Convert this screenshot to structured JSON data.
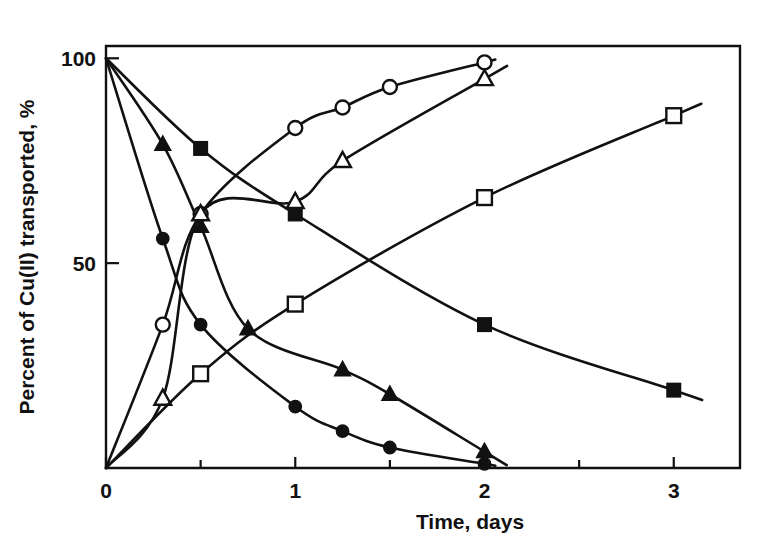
{
  "chart_data": {
    "type": "line",
    "title": "",
    "xlabel": "Time, days",
    "ylabel": "Percent of Cu(II) transported, %",
    "xlim": [
      0,
      3.35
    ],
    "ylim": [
      0,
      103
    ],
    "grid": false,
    "legend_position": "none",
    "x_ticks_major": [
      0,
      1,
      2,
      3
    ],
    "x_tick_labels": [
      "0",
      "1",
      "2",
      "3"
    ],
    "x_ticks_minor": [
      0.5,
      1.5,
      2.5
    ],
    "y_ticks_major": [
      0,
      50,
      100
    ],
    "y_tick_labels": [
      "0",
      "50",
      "100"
    ],
    "series": [
      {
        "name": "Source phase, fast carrier",
        "marker": "filled-circle",
        "direction": "decreasing",
        "x": [
          0,
          0.3,
          0.5,
          1.0,
          1.25,
          1.5,
          2.0
        ],
        "y": [
          100,
          56,
          35,
          15,
          9,
          5,
          1
        ]
      },
      {
        "name": "Source phase, medium carrier",
        "marker": "filled-triangle",
        "direction": "decreasing",
        "x": [
          0,
          0.3,
          0.5,
          0.75,
          1.25,
          1.5,
          2.0
        ],
        "y": [
          100,
          79,
          59,
          34,
          24,
          18,
          4
        ]
      },
      {
        "name": "Source phase, slow carrier",
        "marker": "filled-square",
        "direction": "decreasing",
        "x": [
          0,
          0.5,
          1.0,
          2.0,
          3.0
        ],
        "y": [
          100,
          78,
          62,
          35,
          19
        ]
      },
      {
        "name": "Receiving phase, fast carrier",
        "marker": "open-circle",
        "direction": "increasing",
        "x": [
          0,
          0.3,
          0.5,
          1.0,
          1.25,
          1.5,
          2.0
        ],
        "y": [
          0,
          35,
          62,
          83,
          88,
          93,
          99
        ]
      },
      {
        "name": "Receiving phase, medium carrier",
        "marker": "open-triangle",
        "direction": "increasing",
        "x": [
          0,
          0.3,
          0.5,
          1.0,
          1.25,
          2.0
        ],
        "y": [
          0,
          17,
          62,
          65,
          75,
          95
        ]
      },
      {
        "name": "Receiving phase, slow carrier",
        "marker": "open-square",
        "direction": "increasing",
        "x": [
          0,
          0.5,
          1.0,
          2.0,
          3.0
        ],
        "y": [
          0,
          23,
          40,
          66,
          86
        ]
      }
    ]
  },
  "axes": {
    "x_title": "Time, days",
    "y_title": "Percent of Cu(II) transported, %"
  }
}
